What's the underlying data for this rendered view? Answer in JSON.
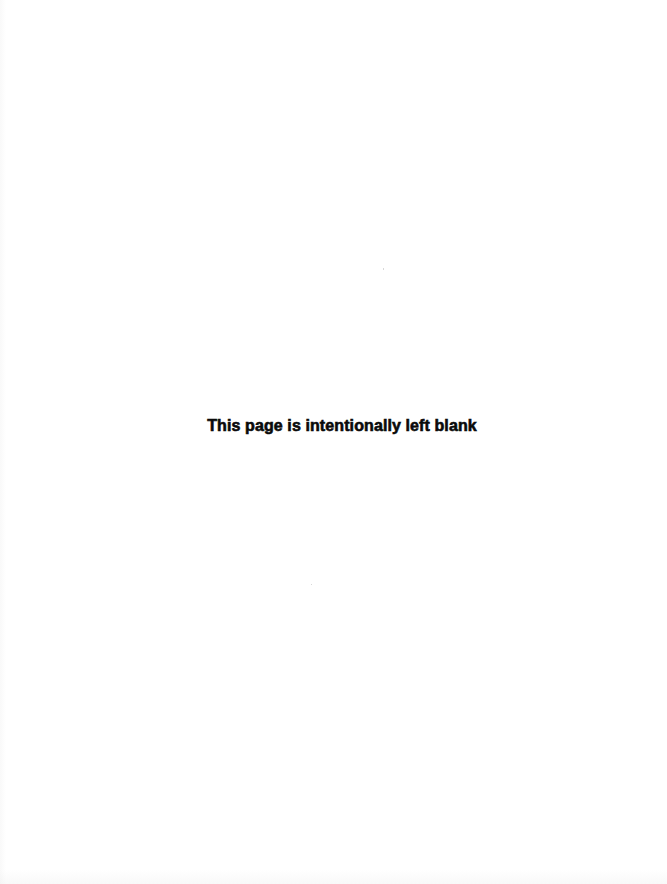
{
  "page": {
    "notice_text": "This page is intentionally left blank",
    "background_color": "#ffffff",
    "text_color": "#0a0a0a"
  }
}
